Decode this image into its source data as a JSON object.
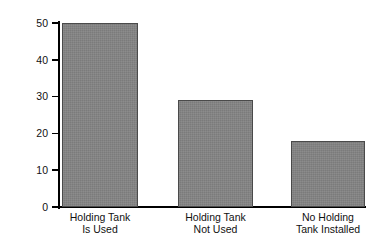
{
  "chart_data": {
    "type": "bar",
    "title": "",
    "xlabel": "",
    "ylabel": "Percent",
    "categories": [
      "Holding Tank\nIs Used",
      "Holding Tank\nNot Used",
      "No Holding\nTank Installed"
    ],
    "values": [
      50,
      29,
      18
    ],
    "ylim": [
      0,
      50
    ],
    "yticks": [
      0,
      10,
      20,
      30,
      40,
      50
    ],
    "ytick_labels": [
      "0",
      "10",
      "20",
      "30",
      "40",
      "50"
    ],
    "grid": false,
    "legend": null,
    "bar_color": "#848484",
    "bar_edge_color": "#4a4a4a",
    "axis_color": "#000000",
    "background": "#ffffff"
  },
  "axis": {
    "y_title": "Percent",
    "tick_labels": [
      "50",
      "40",
      "30",
      "20",
      "10",
      "0"
    ]
  },
  "bars": [
    {
      "label_line1": "Holding Tank",
      "label_line2": "Is Used",
      "value": 50
    },
    {
      "label_line1": "Holding Tank",
      "label_line2": "Not Used",
      "value": 29
    },
    {
      "label_line1": "No Holding",
      "label_line2": "Tank Installed",
      "value": 18
    }
  ]
}
